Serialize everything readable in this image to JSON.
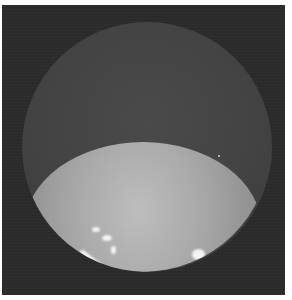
{
  "image": {
    "description": "Grayscale endoscopic view: dark rectangular frame containing a circular field of view; lower portion shows a bright dome-shaped surface with specular highlights",
    "colors": {
      "background_frame": "#2b2b2b",
      "field_of_view": "#434343",
      "dome_highlight": "#bdbdbd",
      "specular": "#f4f4f4",
      "border": "#ffffff"
    }
  }
}
